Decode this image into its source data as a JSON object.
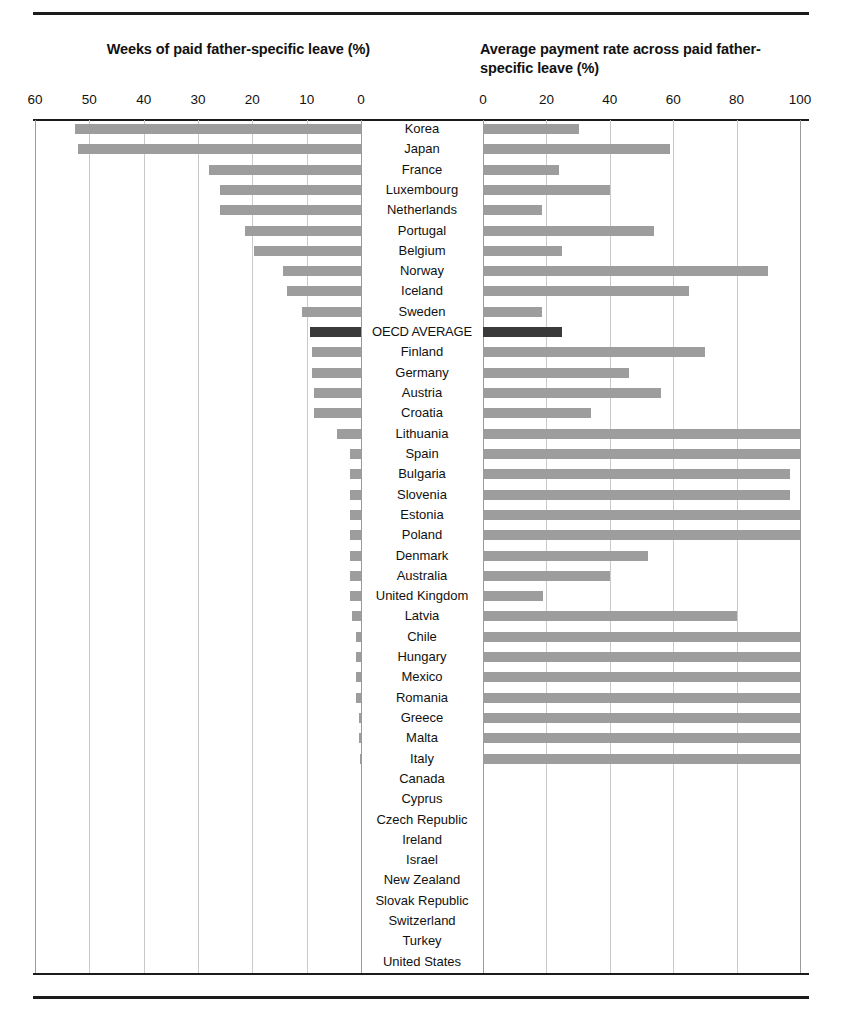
{
  "titles": {
    "left": "Weeks of paid father-specific leave (%)",
    "right": "Average payment rate across paid father-specific leave (%)"
  },
  "axes": {
    "left_ticks": [
      "60",
      "50",
      "40",
      "30",
      "20",
      "10",
      "0"
    ],
    "right_ticks": [
      "0",
      "20",
      "40",
      "60",
      "80",
      "100"
    ]
  },
  "colors": {
    "bar": "#9d9d9d",
    "bar_highlight": "#3a3a3a",
    "gridline": "#c9c9c9",
    "rule": "#1b1b1b"
  },
  "highlight_category": "OECD AVERAGE",
  "chart_data": {
    "type": "bar",
    "orientation": "horizontal",
    "panels": [
      {
        "name": "weeks",
        "title": "Weeks of paid father-specific leave (%)",
        "xlabel": "",
        "ylabel": "",
        "xlim": [
          60,
          0
        ],
        "reversed": true,
        "ticks": [
          60,
          50,
          40,
          30,
          20,
          10,
          0
        ],
        "grid": true
      },
      {
        "name": "payment_rate",
        "title": "Average payment rate across paid father-specific leave (%)",
        "xlabel": "",
        "ylabel": "",
        "xlim": [
          0,
          100
        ],
        "reversed": false,
        "ticks": [
          0,
          20,
          40,
          60,
          80,
          100
        ],
        "grid": true
      }
    ],
    "categories": [
      "Korea",
      "Japan",
      "France",
      "Luxembourg",
      "Netherlands",
      "Portugal",
      "Belgium",
      "Norway",
      "Iceland",
      "Sweden",
      "OECD AVERAGE",
      "Finland",
      "Germany",
      "Austria",
      "Croatia",
      "Lithuania",
      "Spain",
      "Bulgaria",
      "Slovenia",
      "Estonia",
      "Poland",
      "Denmark",
      "Australia",
      "United Kingdom",
      "Latvia",
      "Chile",
      "Hungary",
      "Mexico",
      "Romania",
      "Greece",
      "Malta",
      "Italy",
      "Canada",
      "Cyprus",
      "Czech Republic",
      "Ireland",
      "Israel",
      "New Zealand",
      "Slovak Republic",
      "Switzerland",
      "Turkey",
      "United States"
    ],
    "series": [
      {
        "name": "Weeks of paid father-specific leave (%)",
        "panel": "weeks",
        "values": [
          52.6,
          52.0,
          28.0,
          26.0,
          26.0,
          21.4,
          19.7,
          14.4,
          13.6,
          10.8,
          9.4,
          9.0,
          9.0,
          8.7,
          8.7,
          4.4,
          2.1,
          2.1,
          2.1,
          2.0,
          2.0,
          2.0,
          2.0,
          2.0,
          1.6,
          1.0,
          1.0,
          1.0,
          1.0,
          0.4,
          0.4,
          0.2,
          0,
          0,
          0,
          0,
          0,
          0,
          0,
          0,
          0,
          0
        ]
      },
      {
        "name": "Average payment rate across paid father-specific leave (%)",
        "panel": "payment_rate",
        "values": [
          30.4,
          59.0,
          24.0,
          40.0,
          18.6,
          54.0,
          25.0,
          90.0,
          65.0,
          18.6,
          25.0,
          70.0,
          46.0,
          56.0,
          34.0,
          100.0,
          100.0,
          97.0,
          97.0,
          100.0,
          100.0,
          52.0,
          40.0,
          19.0,
          80.0,
          100.0,
          100.0,
          100.0,
          100.0,
          100.0,
          100.0,
          100.0,
          null,
          null,
          null,
          null,
          null,
          null,
          null,
          null,
          null,
          null
        ]
      }
    ]
  }
}
